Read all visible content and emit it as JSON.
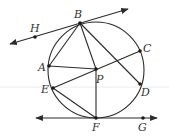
{
  "diagram": {
    "type": "geometry",
    "colors": {
      "stroke": "#2b2b2b",
      "label": "#333333",
      "background": "#ffffff",
      "artifact_line": "#ececec"
    },
    "circle": {
      "cx": 96,
      "cy": 70,
      "r": 48
    },
    "points": {
      "B": {
        "label": "B",
        "x": 80,
        "y": 23,
        "lx": 74,
        "ly": 18
      },
      "H": {
        "label": "H",
        "x": 35,
        "y": 37,
        "lx": 30,
        "ly": 32
      },
      "C": {
        "label": "C",
        "x": 140,
        "y": 51,
        "lx": 143,
        "ly": 52
      },
      "A": {
        "label": "A",
        "x": 49,
        "y": 66,
        "lx": 38,
        "ly": 71
      },
      "P": {
        "label": "P",
        "x": 96,
        "y": 69,
        "lx": 96,
        "ly": 83
      },
      "E": {
        "label": "E",
        "x": 53,
        "y": 88,
        "lx": 41,
        "ly": 93
      },
      "D": {
        "label": "D",
        "x": 140,
        "y": 84,
        "lx": 141,
        "ly": 96
      },
      "F": {
        "label": "F",
        "x": 96,
        "y": 118,
        "lx": 92,
        "ly": 131
      },
      "G": {
        "label": "G",
        "x": 143,
        "y": 118,
        "lx": 138,
        "ly": 131
      }
    },
    "tangent_lines": [
      {
        "name": "line-HB",
        "through": [
          "H",
          "B"
        ],
        "arrows": "both"
      },
      {
        "name": "line-FG",
        "through": [
          "F",
          "G"
        ],
        "arrows": "both"
      }
    ],
    "segments": [
      [
        "B",
        "A"
      ],
      [
        "B",
        "P"
      ],
      [
        "B",
        "D"
      ],
      [
        "A",
        "P"
      ],
      [
        "E",
        "C"
      ],
      [
        "E",
        "F"
      ],
      [
        "P",
        "F"
      ]
    ]
  }
}
